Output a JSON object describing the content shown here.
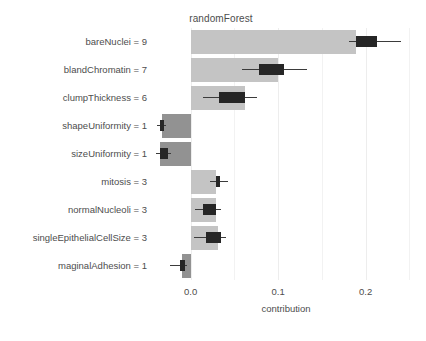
{
  "chart_data": {
    "type": "bar",
    "title": "randomForest",
    "xlabel": "contribution",
    "ylabel": "",
    "orientation": "horizontal",
    "xlim": [
      -0.035,
      0.253
    ],
    "xticks": [
      0.0,
      0.1,
      0.2
    ],
    "xticklabels": [
      "0.0",
      "0.1",
      "0.2"
    ],
    "grid": true,
    "legend": null,
    "categories": [
      "bareNuclei = 9",
      "blandChromatin = 7",
      "clumpThickness = 6",
      "shapeUniformity = 1",
      "sizeUniformity = 1",
      "mitosis = 3",
      "normalNucleoli = 3",
      "singleEpithelialCellSize = 3",
      "maginalAdhesion = 1"
    ],
    "values": [
      0.189,
      0.1,
      0.062,
      -0.033,
      -0.035,
      0.029,
      0.029,
      0.031,
      -0.01
    ],
    "boxplots": [
      {
        "category": "bareNuclei = 9",
        "whisker_low": 0.181,
        "q1": 0.189,
        "median": 0.21,
        "q3": 0.213,
        "whisker_high": 0.24
      },
      {
        "category": "blandChromatin = 7",
        "whisker_low": 0.059,
        "q1": 0.078,
        "median": 0.09,
        "q3": 0.107,
        "whisker_high": 0.133
      },
      {
        "category": "clumpThickness = 6",
        "whisker_low": 0.014,
        "q1": 0.032,
        "median": 0.048,
        "q3": 0.062,
        "whisker_high": 0.076
      },
      {
        "category": "shapeUniformity = 1",
        "whisker_low": -0.039,
        "q1": -0.035,
        "median": -0.033,
        "q3": -0.03,
        "whisker_high": -0.028
      },
      {
        "category": "sizeUniformity = 1",
        "whisker_low": -0.04,
        "q1": -0.035,
        "median": -0.031,
        "q3": -0.026,
        "whisker_high": -0.022
      },
      {
        "category": "mitosis = 3",
        "whisker_low": 0.022,
        "q1": 0.029,
        "median": 0.031,
        "q3": 0.034,
        "whisker_high": 0.043
      },
      {
        "category": "normalNucleoli = 3",
        "whisker_low": 0.005,
        "q1": 0.014,
        "median": 0.021,
        "q3": 0.029,
        "whisker_high": 0.035
      },
      {
        "category": "singleEpithelialCellSize = 3",
        "whisker_low": 0.004,
        "q1": 0.017,
        "median": 0.025,
        "q3": 0.035,
        "whisker_high": 0.04
      },
      {
        "category": "maginalAdhesion = 1",
        "whisker_low": -0.024,
        "q1": -0.012,
        "median": -0.01,
        "q3": -0.007,
        "whisker_high": -0.004
      }
    ],
    "colors": {
      "positive_bar": "#c4c4c4",
      "negative_bar": "#929292",
      "box": "#262626",
      "whisker": "#3b3b3b",
      "gridline": "#f2f2f2",
      "text": "#4d4d4d",
      "background": "#ffffff"
    }
  }
}
